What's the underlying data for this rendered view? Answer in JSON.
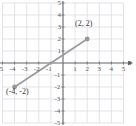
{
  "figure": {
    "width": 136,
    "height": 126,
    "background": "#ffffff"
  },
  "colors": {
    "grid": "#d8d9de",
    "axis": "#6e6e72",
    "segment": "#9b9b9f",
    "point": "#97979b",
    "text": "#414143"
  },
  "axis_names": {
    "x": "x",
    "y": ""
  },
  "chart_data": {
    "type": "line",
    "title": "",
    "subtitle": "",
    "xlabel": "x",
    "ylabel": "",
    "xlim": [
      -5,
      5
    ],
    "ylim": [
      -5,
      5
    ],
    "grid": true,
    "grid_step": 1,
    "legend": "none",
    "x_ticks": [
      -5,
      -4,
      -3,
      -2,
      -1,
      1,
      2,
      3,
      4,
      5
    ],
    "y_ticks": [
      5,
      4,
      3,
      2,
      1,
      -1,
      -2,
      -3,
      -4,
      -5
    ],
    "x_tick_labels": [
      "-5",
      "-4",
      "-3",
      "-2",
      "-1",
      "1",
      "2",
      "3",
      "4",
      "5"
    ],
    "y_tick_labels": [
      "5",
      "4",
      "3",
      "2",
      "1",
      "-1",
      "-2",
      "-3",
      "-4",
      "-5"
    ],
    "series": [
      {
        "name": "segment",
        "type": "line-segment",
        "x": [
          -4,
          2
        ],
        "y": [
          -2,
          2
        ],
        "markers": true
      }
    ],
    "annotations": [
      {
        "text": "(2, 2)",
        "x": 2,
        "y": 2,
        "position": "above-left"
      },
      {
        "text": "(-4, -2)",
        "x": -4,
        "y": -2,
        "position": "below-right"
      }
    ]
  },
  "x_tick_labels": [
    {
      "text": "-5",
      "value": -5
    },
    {
      "text": "-4",
      "value": -4
    },
    {
      "text": "-3",
      "value": -3
    },
    {
      "text": "-2",
      "value": -2
    },
    {
      "text": "-1",
      "value": -1
    },
    {
      "text": "1",
      "value": 1
    },
    {
      "text": "2",
      "value": 2
    },
    {
      "text": "3",
      "value": 3
    },
    {
      "text": "4",
      "value": 4
    },
    {
      "text": "5",
      "value": 5
    }
  ],
  "y_tick_labels": [
    {
      "text": "5",
      "value": 5
    },
    {
      "text": "4",
      "value": 4
    },
    {
      "text": "3",
      "value": 3
    },
    {
      "text": "2",
      "value": 2
    },
    {
      "text": "1",
      "value": 1
    },
    {
      "text": "-1",
      "value": -1
    },
    {
      "text": "-2",
      "value": -2
    },
    {
      "text": "-3",
      "value": -3
    },
    {
      "text": "-4",
      "value": -4
    },
    {
      "text": "-5",
      "value": -5
    }
  ],
  "point_labels": [
    {
      "text": "(2, 2)"
    },
    {
      "text": "(-4, -2)"
    }
  ]
}
